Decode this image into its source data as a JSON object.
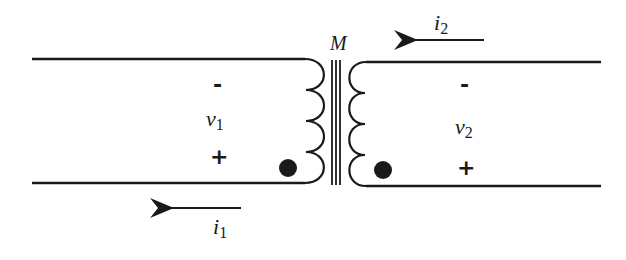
{
  "diagram": {
    "type": "coupled-inductor-circuit",
    "mutual_label": "M",
    "left_port": {
      "voltage_symbol": "v",
      "voltage_subscript": "1",
      "top_sign": "-",
      "bottom_sign": "+",
      "current_symbol": "i",
      "current_subscript": "1",
      "current_direction": "left",
      "dot": "bottom"
    },
    "right_port": {
      "voltage_symbol": "v",
      "voltage_subscript": "2",
      "top_sign": "-",
      "bottom_sign": "+",
      "current_symbol": "i",
      "current_subscript": "2",
      "current_direction": "left",
      "dot": "bottom"
    },
    "colors": {
      "ink": "#1a1a1a",
      "background": "#ffffff"
    }
  }
}
